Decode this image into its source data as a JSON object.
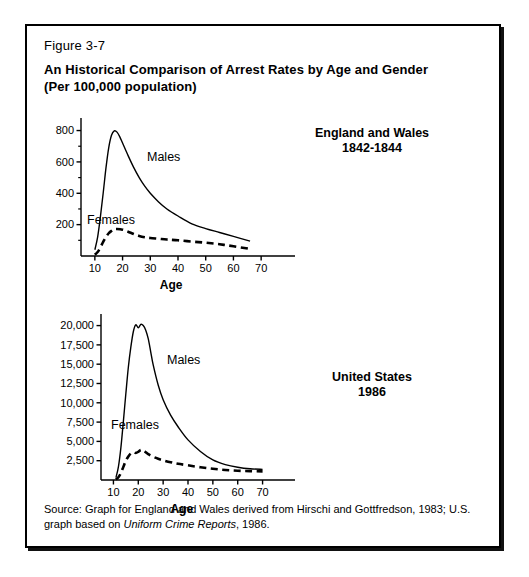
{
  "figure": {
    "number": "Figure 3-7",
    "title_line1": "An Historical Comparison of Arrest Rates by Age and Gender",
    "title_line2": "(Per 100,000 population)",
    "source_prefix": "Source: Graph for England and Wales derived from Hirschi and Gottfredson, 1983; U.S. graph based on ",
    "source_italic": "Uniform Crime Reports",
    "source_suffix": ", 1986."
  },
  "panels": {
    "england": {
      "region_line1": "England and Wales",
      "region_line2": "1842-1844",
      "males_label": "Males",
      "females_label": "Females",
      "axis_title": "Age"
    },
    "united_states": {
      "region_line1": "United States",
      "region_line2": "1986",
      "males_label": "Males",
      "females_label": "Females",
      "axis_title": "Age"
    }
  },
  "chart_data": [
    {
      "id": "england-wales",
      "type": "line",
      "title": "England and Wales 1842-1844",
      "xlabel": "Age",
      "ylabel": "",
      "xlim": [
        5,
        75
      ],
      "ylim": [
        0,
        880
      ],
      "xticks": [
        10,
        20,
        30,
        40,
        50,
        60,
        70
      ],
      "xtick_labels": [
        "10",
        "20",
        "30",
        "40",
        "50",
        "60",
        "70"
      ],
      "yticks": [
        200,
        400,
        600,
        800
      ],
      "ytick_labels": [
        "200",
        "400",
        "600",
        "800"
      ],
      "yminor_ticks": [
        100,
        300,
        500,
        700
      ],
      "grid": false,
      "legend": "inline-annotations",
      "series": [
        {
          "name": "Males",
          "style": "solid",
          "x": [
            10,
            11,
            12,
            13,
            14,
            15,
            16,
            17,
            18,
            19,
            20,
            22,
            24,
            26,
            28,
            30,
            33,
            36,
            40,
            45,
            50,
            55,
            60,
            66
          ],
          "values": [
            40,
            120,
            250,
            400,
            560,
            690,
            770,
            798,
            790,
            760,
            720,
            640,
            565,
            500,
            445,
            400,
            345,
            300,
            255,
            205,
            175,
            150,
            125,
            95
          ]
        },
        {
          "name": "Females",
          "style": "dashed",
          "x": [
            10,
            11,
            12,
            13,
            14,
            15,
            16,
            17,
            18,
            20,
            22,
            24,
            26,
            28,
            30,
            33,
            36,
            40,
            45,
            50,
            55,
            60,
            66
          ],
          "values": [
            8,
            25,
            55,
            90,
            120,
            145,
            160,
            170,
            172,
            168,
            155,
            140,
            128,
            120,
            115,
            110,
            105,
            100,
            92,
            85,
            75,
            62,
            45
          ]
        }
      ]
    },
    {
      "id": "united-states",
      "type": "line",
      "title": "United States 1986",
      "xlabel": "Age",
      "ylabel": "",
      "xlim": [
        5,
        75
      ],
      "ylim": [
        0,
        21500
      ],
      "xticks": [
        10,
        20,
        30,
        40,
        50,
        60,
        70
      ],
      "xtick_labels": [
        "10",
        "20",
        "30",
        "40",
        "50",
        "60",
        "70"
      ],
      "yticks": [
        2500,
        5000,
        7500,
        10000,
        12500,
        15000,
        17500,
        20000
      ],
      "ytick_labels": [
        "2,500",
        "5,000",
        "7,500",
        "10,000",
        "12,500",
        "15,000",
        "17,500",
        "20,000"
      ],
      "grid": false,
      "legend": "inline-annotations",
      "series": [
        {
          "name": "Males",
          "style": "solid",
          "x": [
            11,
            12,
            13,
            14,
            15,
            16,
            17,
            18,
            19,
            20,
            21,
            22,
            23,
            24,
            25,
            26,
            28,
            30,
            33,
            36,
            40,
            45,
            50,
            55,
            60,
            65,
            70
          ],
          "values": [
            300,
            1700,
            4200,
            7600,
            11200,
            14600,
            17200,
            19200,
            20100,
            19700,
            20150,
            20000,
            19400,
            18300,
            16600,
            14900,
            12300,
            10400,
            8400,
            6900,
            5200,
            3700,
            2600,
            2000,
            1650,
            1450,
            1380
          ]
        },
        {
          "name": "Females",
          "style": "dashed",
          "x": [
            11,
            12,
            13,
            14,
            15,
            16,
            17,
            18,
            19,
            20,
            21,
            22,
            23,
            24,
            26,
            28,
            30,
            33,
            36,
            40,
            45,
            50,
            55,
            60,
            65,
            70
          ],
          "values": [
            80,
            350,
            900,
            1700,
            2500,
            3050,
            3450,
            3600,
            3500,
            3650,
            3900,
            3850,
            3600,
            3350,
            3000,
            2750,
            2550,
            2300,
            2100,
            1900,
            1650,
            1450,
            1300,
            1200,
            1150,
            1120
          ]
        }
      ]
    }
  ]
}
